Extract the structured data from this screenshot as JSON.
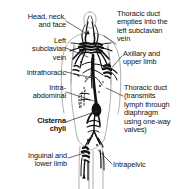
{
  "figure": {
    "background_color": "#ffffff",
    "ink_color": "#111111",
    "width": 191,
    "height": 189
  },
  "labels": [
    {
      "id": "head-neck-face",
      "text": "Head, neck,\nand face",
      "align": "right",
      "bold": false,
      "side": "left",
      "x": 3,
      "y": 13,
      "width": 63
    },
    {
      "id": "left-subclavian-vein",
      "text": "Left\nsubclavian\nvein",
      "align": "right",
      "bold": false,
      "side": "left",
      "x": 3,
      "y": 37,
      "width": 63
    },
    {
      "id": "intrathoracic",
      "text": "Intrathoracic",
      "align": "right",
      "bold": false,
      "side": "left",
      "x": 3,
      "y": 69,
      "width": 63
    },
    {
      "id": "intra-abdominal",
      "text": "Intra-\nabdominal",
      "align": "right",
      "bold": false,
      "side": "left",
      "x": 3,
      "y": 84,
      "width": 63
    },
    {
      "id": "cisterna-chyli",
      "text": "Cisterna\nchyli",
      "align": "right",
      "bold": true,
      "side": "left",
      "x": 3,
      "y": 117,
      "width": 63
    },
    {
      "id": "inguinal-and-lower-limb",
      "text": "Inguinal and\nlower limb",
      "align": "right",
      "bold": false,
      "side": "left",
      "x": 3,
      "y": 152,
      "width": 64
    },
    {
      "id": "thoracic-duct-empties",
      "text": "Thoracic duct\nempties into the\nleft subclavian\nvein",
      "align": "left",
      "bold": false,
      "side": "right",
      "x": 117,
      "y": 10,
      "width": 72
    },
    {
      "id": "axillary-and-upper-limb",
      "text": "Axillary and\nupper limb",
      "align": "left",
      "bold": false,
      "side": "right",
      "x": 123,
      "y": 50,
      "width": 66
    },
    {
      "id": "thoracic-duct-transmits",
      "text": "Thoracic duct\n(transmits\nlymph through\ndiaphragm\nusing one-way\nvalves)",
      "align": "left",
      "bold": false,
      "side": "right",
      "x": 124,
      "y": 84,
      "width": 66
    },
    {
      "id": "intrapelvic",
      "text": "Intrapelvic",
      "align": "left",
      "bold": false,
      "side": "right",
      "x": 113,
      "y": 161,
      "width": 55
    }
  ],
  "leader_lines": [
    {
      "id": "leader-head-neck-face",
      "from": [
        66,
        21
      ],
      "to": [
        87,
        34
      ]
    },
    {
      "id": "leader-left-subclavian-vein",
      "from": [
        66,
        48
      ],
      "to": [
        88,
        57
      ]
    },
    {
      "id": "leader-intrathoracic",
      "from": [
        66,
        72
      ],
      "to": [
        93,
        78
      ]
    },
    {
      "id": "leader-intra-abdominal",
      "from": [
        66,
        92
      ],
      "to": [
        97,
        102
      ]
    },
    {
      "id": "leader-cisterna-chyli",
      "from": [
        66,
        122
      ],
      "to": [
        100,
        110
      ]
    },
    {
      "id": "leader-inguinal-lower-limb",
      "from": [
        68,
        158
      ],
      "to": [
        88,
        152
      ]
    },
    {
      "id": "leader-thoracic-duct-empties",
      "from": [
        116,
        44
      ],
      "to": [
        104,
        36
      ]
    },
    {
      "id": "leader-axillary-upper-limb",
      "from": [
        122,
        56
      ],
      "to": [
        108,
        72
      ]
    },
    {
      "id": "leader-thoracic-duct-transmits",
      "from": [
        123,
        96
      ],
      "to": [
        106,
        88
      ]
    },
    {
      "id": "leader-intrapelvic",
      "from": [
        112,
        164
      ],
      "to": [
        98,
        150
      ]
    }
  ],
  "anatomy": {
    "body_outline": "human torso silhouette, anterior view, head and shoulders at top, limbs cropped",
    "vessel_network": "lymphatic vessels and nodes drawn in black ink",
    "node_clusters": [
      "cervical",
      "axillary",
      "thoracic",
      "abdominal",
      "pelvic",
      "inguinal"
    ]
  }
}
